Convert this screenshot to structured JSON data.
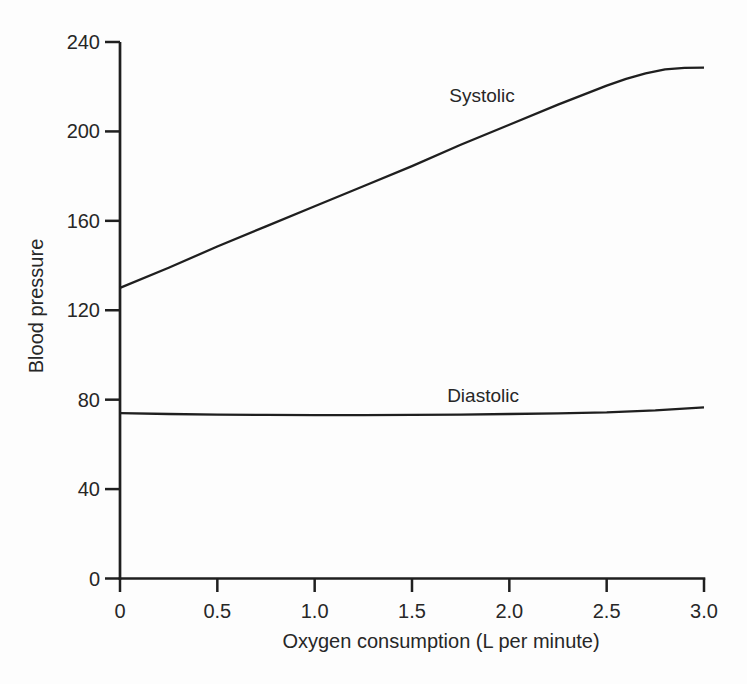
{
  "chart_data": {
    "type": "line",
    "title": "",
    "xlabel": "Oxygen consumption (L per minute)",
    "ylabel": "Blood pressure",
    "xlim": [
      0,
      3.0
    ],
    "ylim": [
      0,
      240
    ],
    "grid": false,
    "legend_position": "inline-annotations",
    "x_ticks": [
      0,
      0.5,
      1.0,
      1.5,
      2.0,
      2.5,
      3.0
    ],
    "x_tick_labels": [
      "0",
      "0.5",
      "1.0",
      "1.5",
      "2.0",
      "2.5",
      "3.0"
    ],
    "y_ticks": [
      0,
      40,
      80,
      120,
      160,
      200,
      240
    ],
    "y_tick_labels": [
      "0",
      "40",
      "80",
      "120",
      "160",
      "200",
      "240"
    ],
    "line_color": "#1f1f1f",
    "axis_color": "#1f1f1f",
    "background_color": "#fdfdfd",
    "series": [
      {
        "name": "Systolic",
        "x": [
          0,
          0.25,
          0.5,
          0.75,
          1.0,
          1.25,
          1.5,
          1.75,
          2.0,
          2.25,
          2.5,
          2.6,
          2.7,
          2.8,
          2.9,
          3.0
        ],
        "y": [
          130,
          139,
          148.5,
          157.5,
          166.5,
          175.5,
          184.5,
          194,
          203,
          212,
          220.5,
          223.5,
          226,
          227.8,
          228.4,
          228.5
        ],
        "label": "Systolic",
        "label_anchor": {
          "x": 1.86,
          "y": 213
        }
      },
      {
        "name": "Diastolic",
        "x": [
          0,
          0.25,
          0.5,
          0.75,
          1.0,
          1.25,
          1.5,
          1.75,
          2.0,
          2.25,
          2.5,
          2.75,
          3.0
        ],
        "y": [
          74,
          73.6,
          73.3,
          73.2,
          73.1,
          73.1,
          73.2,
          73.3,
          73.6,
          73.9,
          74.3,
          75.2,
          76.6
        ],
        "label": "Diastolic",
        "label_anchor": {
          "x": 1.865,
          "y": 79
        }
      }
    ]
  }
}
